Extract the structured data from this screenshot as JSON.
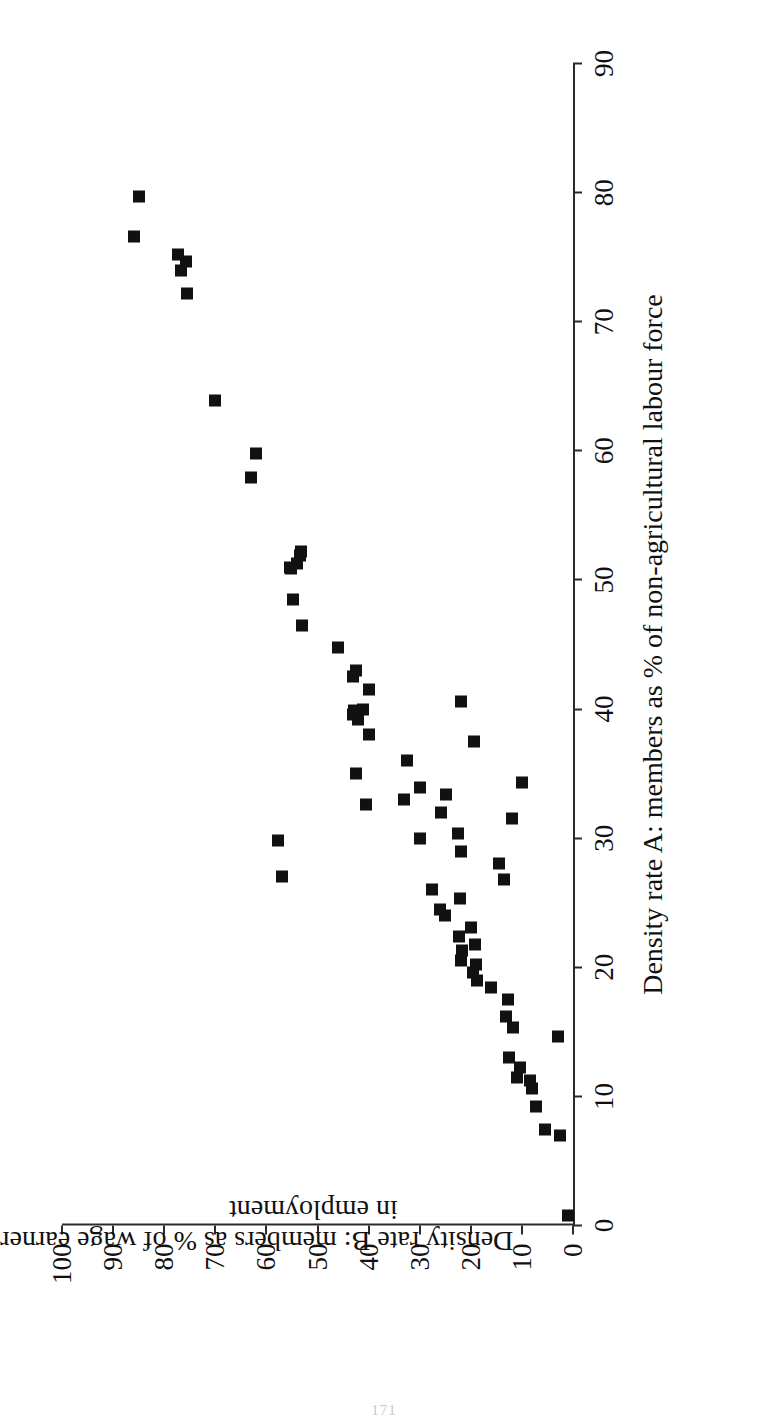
{
  "page": {
    "folio": "171"
  },
  "chart_data": {
    "type": "scatter",
    "title": "",
    "xlabel": "Density rate A: members as % of non-agricultural labour force",
    "ylabel_line1": "Density rate B:  members as % of wage earners",
    "ylabel_line2": "in employment",
    "xlim": [
      0,
      90
    ],
    "ylim": [
      0,
      100
    ],
    "xticks": [
      0,
      10,
      20,
      30,
      40,
      50,
      60,
      70,
      80,
      90
    ],
    "yticks": [
      0,
      10,
      20,
      30,
      40,
      50,
      60,
      70,
      80,
      90,
      100
    ],
    "xtick_labels": [
      "0",
      "10",
      "20",
      "30",
      "40",
      "50",
      "60",
      "70",
      "80",
      "90"
    ],
    "ytick_labels": [
      "0",
      "10",
      "20",
      "30",
      "40",
      "50",
      "60",
      "70",
      "80",
      "90",
      "100"
    ],
    "grid": false,
    "legend": false,
    "marker": "filled-square",
    "marker_color": "#111111",
    "series": [
      {
        "name": "Countries",
        "points": [
          [
            0.8,
            1.0
          ],
          [
            7.0,
            2.6
          ],
          [
            7.4,
            5.5
          ],
          [
            9.2,
            7.2
          ],
          [
            10.6,
            8.1
          ],
          [
            11.2,
            8.4
          ],
          [
            11.5,
            11.0
          ],
          [
            12.2,
            10.4
          ],
          [
            13.0,
            12.5
          ],
          [
            14.6,
            3.0
          ],
          [
            15.3,
            11.7
          ],
          [
            16.2,
            13.2
          ],
          [
            17.5,
            12.8
          ],
          [
            18.4,
            16.0
          ],
          [
            19.0,
            18.8
          ],
          [
            19.6,
            19.5
          ],
          [
            20.2,
            19.0
          ],
          [
            20.5,
            22.0
          ],
          [
            21.3,
            21.7
          ],
          [
            21.8,
            19.2
          ],
          [
            22.4,
            22.3
          ],
          [
            23.1,
            20.0
          ],
          [
            24.0,
            25.0
          ],
          [
            24.5,
            26.0
          ],
          [
            25.3,
            22.2
          ],
          [
            26.0,
            27.5
          ],
          [
            26.8,
            13.6
          ],
          [
            27.0,
            57.0
          ],
          [
            28.0,
            14.5
          ],
          [
            29.0,
            22.0
          ],
          [
            29.8,
            57.8
          ],
          [
            30.0,
            30.0
          ],
          [
            30.4,
            22.6
          ],
          [
            31.5,
            12.0
          ],
          [
            32.0,
            25.8
          ],
          [
            32.6,
            40.6
          ],
          [
            33.0,
            33.0
          ],
          [
            33.4,
            24.8
          ],
          [
            33.9,
            30.0
          ],
          [
            34.3,
            10.0
          ],
          [
            35.0,
            42.5
          ],
          [
            36.0,
            32.5
          ],
          [
            37.5,
            19.4
          ],
          [
            38.0,
            40.0
          ],
          [
            39.2,
            42.0
          ],
          [
            39.6,
            43.0
          ],
          [
            39.9,
            42.8
          ],
          [
            40.0,
            41.0
          ],
          [
            40.6,
            22.0
          ],
          [
            41.5,
            40.0
          ],
          [
            42.5,
            43.0
          ],
          [
            43.0,
            42.5
          ],
          [
            44.8,
            46.0
          ],
          [
            46.5,
            53.0
          ],
          [
            48.5,
            54.7
          ],
          [
            50.9,
            55.2
          ],
          [
            51.0,
            55.3
          ],
          [
            51.3,
            54.0
          ],
          [
            51.9,
            53.5
          ],
          [
            52.2,
            53.2
          ],
          [
            57.9,
            63.0
          ],
          [
            59.8,
            62.0
          ],
          [
            63.9,
            70.0
          ],
          [
            72.2,
            75.5
          ],
          [
            74.0,
            76.7
          ],
          [
            74.7,
            75.7
          ],
          [
            75.2,
            77.3
          ],
          [
            76.6,
            86.0
          ],
          [
            79.7,
            85.0
          ]
        ]
      }
    ]
  }
}
